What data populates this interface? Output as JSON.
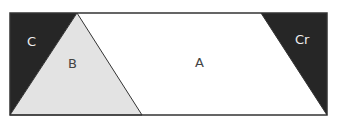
{
  "diagram": {
    "regions": [
      {
        "id": "C",
        "label": "C",
        "fill": "#262626"
      },
      {
        "id": "B",
        "label": "B",
        "fill": "#e3e3e3"
      },
      {
        "id": "A",
        "label": "A",
        "fill": "#ffffff"
      },
      {
        "id": "Cr",
        "label": "Cr",
        "fill": "#262626"
      }
    ],
    "border_color": "#333333"
  }
}
